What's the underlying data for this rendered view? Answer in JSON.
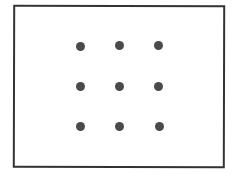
{
  "diagram": {
    "title": "",
    "type": "3x3 dot grid in rectangle",
    "colors": {
      "border": "#333333",
      "dot": "#4a4a4a",
      "background": "#ffffff"
    },
    "grid": {
      "rows": 3,
      "cols": 3
    },
    "dots": [
      {
        "x": 80,
        "y": 46
      },
      {
        "x": 119,
        "y": 45
      },
      {
        "x": 158,
        "y": 45
      },
      {
        "x": 80,
        "y": 86
      },
      {
        "x": 119,
        "y": 86
      },
      {
        "x": 158,
        "y": 86
      },
      {
        "x": 80,
        "y": 126
      },
      {
        "x": 119,
        "y": 126
      },
      {
        "x": 159,
        "y": 126
      }
    ]
  }
}
